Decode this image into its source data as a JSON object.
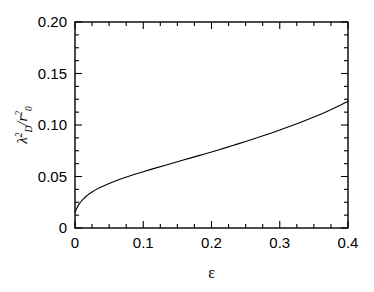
{
  "chart_data": {
    "type": "line",
    "title": "",
    "subtitle": "",
    "xlabel": "ε",
    "ylabel": "λ²_D / r²₀",
    "ylabel_parts": {
      "lambda": "λ",
      "lambda_sup": "2",
      "lambda_sub": "D",
      "slash": "/",
      "r": "r",
      "r_sup": "2",
      "r_sub": "0"
    },
    "xlim": [
      0,
      0.4
    ],
    "ylim": [
      0,
      0.2
    ],
    "xticks": [
      "0",
      "0.1",
      "0.2",
      "0.3",
      "0.4"
    ],
    "xtick_values": [
      0,
      0.1,
      0.2,
      0.3,
      0.4
    ],
    "yticks": [
      "0",
      "0.05",
      "0.10",
      "0.15",
      "0.20"
    ],
    "ytick_values": [
      0,
      0.05,
      0.1,
      0.15,
      0.2
    ],
    "x_minor_step": 0.025,
    "y_minor_step": 0.0125,
    "grid": false,
    "legend": null,
    "legend_position": "none",
    "frame": true,
    "tick_direction": "in",
    "line_color": "#000000",
    "line_width": 1.1,
    "series": [
      {
        "name": "lambda_D^2 / r_0^2",
        "x": [
          0.0,
          0.002,
          0.005,
          0.008,
          0.012,
          0.016,
          0.02,
          0.025,
          0.03,
          0.035,
          0.04,
          0.05,
          0.06,
          0.07,
          0.08,
          0.09,
          0.1,
          0.11,
          0.12,
          0.13,
          0.14,
          0.15,
          0.16,
          0.17,
          0.18,
          0.19,
          0.2,
          0.21,
          0.22,
          0.23,
          0.24,
          0.25,
          0.26,
          0.27,
          0.28,
          0.29,
          0.3,
          0.31,
          0.32,
          0.33,
          0.34,
          0.35,
          0.36,
          0.37,
          0.38,
          0.39,
          0.4
        ],
        "y": [
          0.015,
          0.0185,
          0.0222,
          0.025,
          0.0281,
          0.0306,
          0.0327,
          0.035,
          0.037,
          0.0388,
          0.0404,
          0.0433,
          0.0459,
          0.0483,
          0.0505,
          0.0526,
          0.0547,
          0.0567,
          0.0586,
          0.0605,
          0.0624,
          0.0643,
          0.0662,
          0.0681,
          0.07,
          0.0719,
          0.0738,
          0.0758,
          0.0778,
          0.0798,
          0.0819,
          0.084,
          0.0861,
          0.0883,
          0.0905,
          0.0928,
          0.0951,
          0.0975,
          0.0999,
          0.1024,
          0.105,
          0.1077,
          0.1105,
          0.1134,
          0.1164,
          0.1196,
          0.123
        ]
      }
    ],
    "annotations": []
  },
  "colors": {
    "background": "#ffffff",
    "foreground": "#000000",
    "curve": "#000000"
  }
}
